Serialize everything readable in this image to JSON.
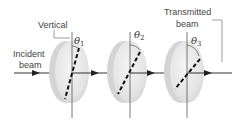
{
  "diagram": {
    "labels": {
      "vertical": "Vertical",
      "incident_line1": "Incident",
      "incident_line2": "beam",
      "transmitted_line1": "Transmitted",
      "transmitted_line2": "beam"
    },
    "polarizers": [
      {
        "theta": "θ",
        "sub": "1"
      },
      {
        "theta": "θ",
        "sub": "2"
      },
      {
        "theta": "θ",
        "sub": "3"
      }
    ],
    "colors": {
      "disk_fill": "#e6e6e6",
      "disk_edge": "#c8c8c8",
      "line": "#333333",
      "text": "#444444"
    }
  }
}
